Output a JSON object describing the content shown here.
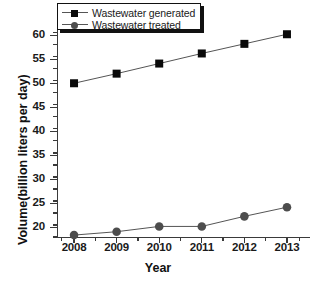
{
  "chart_data": {
    "type": "line",
    "title": "",
    "xlabel": "Year",
    "ylabel": "Volume(billion liters per day)",
    "categories": [
      "2008",
      "2009",
      "2010",
      "2011",
      "2012",
      "2013"
    ],
    "x": [
      2008,
      2009,
      2010,
      2011,
      2012,
      2013
    ],
    "xlim": [
      2007.6,
      2013.4
    ],
    "ylim": [
      18,
      61.5
    ],
    "yticks": [
      20,
      25,
      30,
      35,
      40,
      45,
      50,
      55,
      60
    ],
    "ytick_labels": [
      "20",
      "25",
      "30",
      "35",
      "40",
      "45",
      "50",
      "55",
      "60"
    ],
    "ytick_minor_step": 2.5,
    "grid": false,
    "legend_position": "top-left",
    "series": [
      {
        "name": "Wastewater generated",
        "marker": "square",
        "color": "#0a0a0a",
        "line_color": "#555555",
        "values": [
          50.0,
          52.0,
          54.1,
          56.2,
          58.2,
          60.2
        ]
      },
      {
        "name": "Wastewater treated",
        "marker": "circle",
        "color": "#4d4d4d",
        "line_color": "#555555",
        "values": [
          18.4,
          19.1,
          20.2,
          20.2,
          22.3,
          24.2
        ]
      }
    ]
  },
  "legend": {
    "items": [
      {
        "label": "Wastewater generated",
        "marker": "square-marker-icon"
      },
      {
        "label": "Wastewater treated",
        "marker": "circle-marker-icon"
      }
    ]
  },
  "colors": {
    "axis": "#3a3a3a",
    "text": "#111111",
    "series_generated": "#0a0a0a",
    "series_treated": "#4d4d4d",
    "line": "#555555",
    "background": "#ffffff"
  }
}
